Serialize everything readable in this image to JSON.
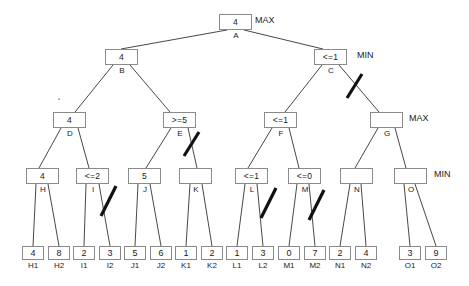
{
  "diagram": {
    "levels": [
      {
        "name": "MAX",
        "label": "MAX"
      },
      {
        "name": "MIN",
        "label": "MIN"
      },
      {
        "name": "MAX",
        "label": "MAX"
      },
      {
        "name": "MIN",
        "label": "MIN"
      }
    ],
    "level_labels": {
      "root": "MAX",
      "level2": "MIN",
      "level3": "MAX",
      "level4": "MIN"
    },
    "nodes": [
      {
        "id": "A",
        "value": "4",
        "label": "A",
        "level": 1,
        "x": 219,
        "y": 14
      },
      {
        "id": "B",
        "value": "4",
        "label": "B",
        "level": 2,
        "x": 105,
        "y": 49
      },
      {
        "id": "C",
        "value": "<=1",
        "label": "C",
        "level": 2,
        "x": 314,
        "y": 49
      },
      {
        "id": "D",
        "value": "4",
        "label": "D",
        "level": 3,
        "x": 53,
        "y": 112
      },
      {
        "id": "E",
        "value": ">=5",
        "label": "E",
        "level": 3,
        "x": 163,
        "y": 112
      },
      {
        "id": "F",
        "value": "<=1",
        "label": "F",
        "level": 3,
        "x": 264,
        "y": 112
      },
      {
        "id": "G",
        "value": "",
        "label": "G",
        "level": 3,
        "x": 370,
        "y": 112
      },
      {
        "id": "H",
        "value": "4",
        "label": "H",
        "level": 4,
        "x": 26,
        "y": 168
      },
      {
        "id": "I",
        "value": "<=2",
        "label": "I",
        "level": 4,
        "x": 76,
        "y": 168
      },
      {
        "id": "J",
        "value": "5",
        "label": "J",
        "level": 4,
        "x": 128,
        "y": 168
      },
      {
        "id": "K",
        "value": "",
        "label": "K",
        "level": 4,
        "x": 179,
        "y": 168
      },
      {
        "id": "L",
        "value": "<=1",
        "label": "L",
        "level": 4,
        "x": 235,
        "y": 168
      },
      {
        "id": "M",
        "value": "<=0",
        "label": "M",
        "level": 4,
        "x": 288,
        "y": 168
      },
      {
        "id": "N",
        "value": "",
        "label": "N",
        "level": 4,
        "x": 340,
        "y": 168
      },
      {
        "id": "O",
        "value": "",
        "label": "O",
        "level": 4,
        "x": 394,
        "y": 168
      }
    ],
    "leaves": [
      {
        "id": "H1",
        "value": "4",
        "label": "H1",
        "x": 22,
        "y": 246
      },
      {
        "id": "H2",
        "value": "8",
        "label": "H2",
        "x": 48,
        "y": 246
      },
      {
        "id": "I1",
        "value": "2",
        "label": "I1",
        "x": 73,
        "y": 246
      },
      {
        "id": "I2",
        "value": "3",
        "label": "I2",
        "x": 99,
        "y": 246
      },
      {
        "id": "J1",
        "value": "5",
        "label": "J1",
        "x": 124,
        "y": 246
      },
      {
        "id": "J2",
        "value": "6",
        "label": "J2",
        "x": 150,
        "y": 246
      },
      {
        "id": "K1",
        "value": "1",
        "label": "K1",
        "x": 175,
        "y": 246
      },
      {
        "id": "K2",
        "value": "2",
        "label": "K2",
        "x": 201,
        "y": 246
      },
      {
        "id": "L1",
        "value": "1",
        "label": "L1",
        "x": 226,
        "y": 246
      },
      {
        "id": "L2",
        "value": "3",
        "label": "L2",
        "x": 252,
        "y": 246
      },
      {
        "id": "M1",
        "value": "0",
        "label": "M1",
        "x": 278,
        "y": 246
      },
      {
        "id": "M2",
        "value": "7",
        "label": "M2",
        "x": 304,
        "y": 246
      },
      {
        "id": "N1",
        "value": "2",
        "label": "N1",
        "x": 329,
        "y": 246
      },
      {
        "id": "N2",
        "value": "4",
        "label": "N2",
        "x": 355,
        "y": 246
      },
      {
        "id": "O1",
        "value": "3",
        "label": "O1",
        "x": 399,
        "y": 246
      },
      {
        "id": "O2",
        "value": "9",
        "label": "O2",
        "x": 425,
        "y": 246
      }
    ],
    "edges": [
      {
        "from": "A",
        "to": "B",
        "x1": 227,
        "y1": 30,
        "x2": 121,
        "y2": 49
      },
      {
        "from": "A",
        "to": "C",
        "x1": 244,
        "y1": 30,
        "x2": 323,
        "y2": 49
      },
      {
        "from": "B",
        "to": "D",
        "x1": 113,
        "y1": 65,
        "x2": 75,
        "y2": 112
      },
      {
        "from": "B",
        "to": "E",
        "x1": 130,
        "y1": 65,
        "x2": 170,
        "y2": 112
      },
      {
        "from": "C",
        "to": "F",
        "x1": 322,
        "y1": 65,
        "x2": 285,
        "y2": 112
      },
      {
        "from": "C",
        "to": "G",
        "x1": 339,
        "y1": 65,
        "x2": 379,
        "y2": 112
      },
      {
        "from": "D",
        "to": "H",
        "x1": 61,
        "y1": 128,
        "x2": 39,
        "y2": 168
      },
      {
        "from": "D",
        "to": "I",
        "x1": 78,
        "y1": 128,
        "x2": 89,
        "y2": 168
      },
      {
        "from": "E",
        "to": "J",
        "x1": 171,
        "y1": 128,
        "x2": 146,
        "y2": 168
      },
      {
        "from": "E",
        "to": "K",
        "x1": 188,
        "y1": 128,
        "x2": 197,
        "y2": 168
      },
      {
        "from": "F",
        "to": "L",
        "x1": 272,
        "y1": 128,
        "x2": 248,
        "y2": 168
      },
      {
        "from": "F",
        "to": "M",
        "x1": 289,
        "y1": 128,
        "x2": 299,
        "y2": 168
      },
      {
        "from": "G",
        "to": "N",
        "x1": 378,
        "y1": 128,
        "x2": 355,
        "y2": 168
      },
      {
        "from": "G",
        "to": "O",
        "x1": 395,
        "y1": 128,
        "x2": 406,
        "y2": 168
      },
      {
        "from": "H",
        "to": "H1",
        "x1": 36,
        "y1": 184,
        "x2": 33,
        "y2": 246
      },
      {
        "from": "H",
        "to": "H2",
        "x1": 48,
        "y1": 184,
        "x2": 59,
        "y2": 246
      },
      {
        "from": "I",
        "to": "I1",
        "x1": 86,
        "y1": 184,
        "x2": 84,
        "y2": 246
      },
      {
        "from": "I",
        "to": "I2",
        "x1": 99,
        "y1": 184,
        "x2": 110,
        "y2": 246
      },
      {
        "from": "J",
        "to": "J1",
        "x1": 138,
        "y1": 184,
        "x2": 135,
        "y2": 246
      },
      {
        "from": "J",
        "to": "J2",
        "x1": 150,
        "y1": 184,
        "x2": 161,
        "y2": 246
      },
      {
        "from": "K",
        "to": "K1",
        "x1": 190,
        "y1": 184,
        "x2": 186,
        "y2": 246
      },
      {
        "from": "K",
        "to": "K2",
        "x1": 202,
        "y1": 184,
        "x2": 212,
        "y2": 246
      },
      {
        "from": "L",
        "to": "L1",
        "x1": 245,
        "y1": 184,
        "x2": 237,
        "y2": 246
      },
      {
        "from": "L",
        "to": "L2",
        "x1": 257,
        "y1": 184,
        "x2": 263,
        "y2": 246
      },
      {
        "from": "M",
        "to": "M1",
        "x1": 297,
        "y1": 184,
        "x2": 289,
        "y2": 246
      },
      {
        "from": "M",
        "to": "M2",
        "x1": 309,
        "y1": 184,
        "x2": 315,
        "y2": 246
      },
      {
        "from": "N",
        "to": "N1",
        "x1": 350,
        "y1": 184,
        "x2": 340,
        "y2": 246
      },
      {
        "from": "N",
        "to": "N2",
        "x1": 361,
        "y1": 184,
        "x2": 366,
        "y2": 246
      },
      {
        "from": "O",
        "to": "O1",
        "x1": 404,
        "y1": 184,
        "x2": 410,
        "y2": 246
      },
      {
        "from": "O",
        "to": "O2",
        "x1": 415,
        "y1": 184,
        "x2": 436,
        "y2": 246
      }
    ],
    "pruned_marks": [
      {
        "on_edge": "C-G",
        "x1": 347,
        "y1": 98,
        "x2": 362,
        "y2": 74
      },
      {
        "on_edge": "E-K",
        "x1": 184,
        "y1": 156,
        "x2": 199,
        "y2": 132
      },
      {
        "on_edge": "I-I2",
        "x1": 101,
        "y1": 216,
        "x2": 116,
        "y2": 186
      },
      {
        "on_edge": "L-L2",
        "x1": 261,
        "y1": 218,
        "x2": 276,
        "y2": 188
      },
      {
        "on_edge": "M-M2",
        "x1": 309,
        "y1": 220,
        "x2": 324,
        "y2": 190
      }
    ],
    "side_labels": [
      {
        "text": "MAX",
        "x": 255,
        "y": 15
      },
      {
        "text": "MIN",
        "x": 357,
        "y": 50
      },
      {
        "text": "MAX",
        "x": 409,
        "y": 113
      },
      {
        "text": "MIN",
        "x": 434,
        "y": 169
      }
    ]
  }
}
